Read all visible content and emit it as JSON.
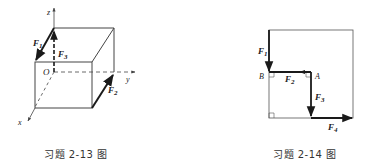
{
  "figures": [
    {
      "id": "2-13",
      "caption": "习题 2-13 图",
      "type": "cube-forces",
      "axes": {
        "x": "x",
        "y": "y",
        "z": "z"
      },
      "origin_label": "O",
      "forces": [
        {
          "name": "F",
          "sub": "1",
          "description": "along top-left edge of cube face"
        },
        {
          "name": "F",
          "sub": "2",
          "description": "along bottom-right edge of cube"
        },
        {
          "name": "F",
          "sub": "3",
          "description": "along z axis from O"
        }
      ]
    },
    {
      "id": "2-14",
      "caption": "习题 2-14 图",
      "type": "square-forces",
      "points": {
        "A": "A",
        "B": "B"
      },
      "forces": [
        {
          "name": "F",
          "sub": "1",
          "description": "down left side to B"
        },
        {
          "name": "F",
          "sub": "2",
          "description": "from A to B"
        },
        {
          "name": "F",
          "sub": "3",
          "description": "down from A"
        },
        {
          "name": "F",
          "sub": "4",
          "description": "right along bottom"
        }
      ]
    }
  ],
  "colors": {
    "line": "#333333",
    "force": "#1a1a1a",
    "thin": "#555555"
  }
}
